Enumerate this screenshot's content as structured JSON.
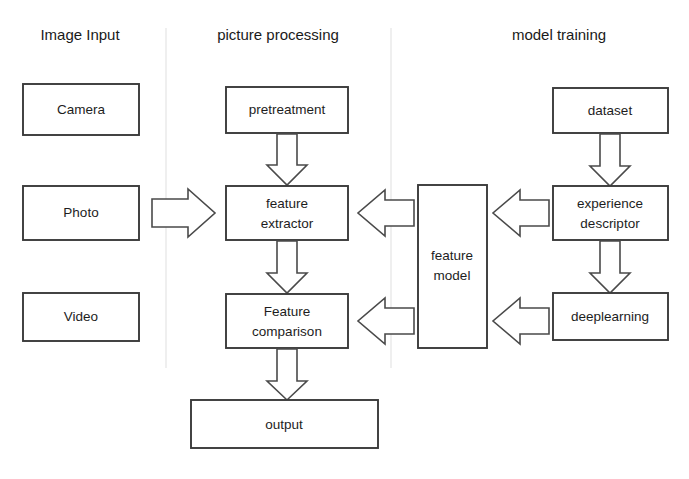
{
  "diagram": {
    "columns": [
      {
        "id": "image-input",
        "label": "Image Input"
      },
      {
        "id": "picture-processing",
        "label": "picture processing"
      },
      {
        "id": "model-training",
        "label": "model training"
      }
    ],
    "nodes": [
      {
        "id": "camera",
        "label": "Camera",
        "column": "image-input",
        "x": 23,
        "y": 84,
        "w": 116,
        "h": 51
      },
      {
        "id": "photo",
        "label": "Photo",
        "column": "image-input",
        "x": 23,
        "y": 186,
        "w": 116,
        "h": 54
      },
      {
        "id": "video",
        "label": "Video",
        "column": "image-input",
        "x": 23,
        "y": 293,
        "w": 116,
        "h": 48
      },
      {
        "id": "pretreatment",
        "label": "pretreatment",
        "column": "picture-processing",
        "x": 226,
        "y": 87,
        "w": 122,
        "h": 46
      },
      {
        "id": "feature-extractor",
        "label": "feature\nextractor",
        "column": "picture-processing",
        "x": 226,
        "y": 186,
        "w": 122,
        "h": 54
      },
      {
        "id": "feature-comparison",
        "label": "Feature\ncomparison",
        "column": "picture-processing",
        "x": 226,
        "y": 294,
        "w": 122,
        "h": 54
      },
      {
        "id": "output",
        "label": "output",
        "column": "picture-processing",
        "x": 191,
        "y": 400,
        "w": 187,
        "h": 48
      },
      {
        "id": "feature-model",
        "label": "feature\nmodel",
        "column": "picture-processing",
        "x": 418,
        "y": 185,
        "w": 69,
        "h": 163
      },
      {
        "id": "dataset",
        "label": "dataset",
        "column": "model-training",
        "x": 553,
        "y": 88,
        "w": 115,
        "h": 45
      },
      {
        "id": "experience-descriptor",
        "label": "experience\ndescriptor",
        "column": "model-training",
        "x": 553,
        "y": 186,
        "w": 115,
        "h": 54
      },
      {
        "id": "deeplearning",
        "label": "deeplearning",
        "column": "model-training",
        "x": 553,
        "y": 293,
        "w": 115,
        "h": 47
      }
    ],
    "edges": [
      {
        "id": "photo-to-feature-extractor",
        "from": "photo",
        "to": "feature-extractor",
        "direction": "right"
      },
      {
        "id": "pretreatment-to-feature-extractor",
        "from": "pretreatment",
        "to": "feature-extractor",
        "direction": "down"
      },
      {
        "id": "feature-extractor-to-feature-comparison",
        "from": "feature-extractor",
        "to": "feature-comparison",
        "direction": "down"
      },
      {
        "id": "feature-comparison-to-output",
        "from": "feature-comparison",
        "to": "output",
        "direction": "down"
      },
      {
        "id": "feature-model-to-feature-extractor",
        "from": "feature-model",
        "to": "feature-extractor",
        "direction": "left"
      },
      {
        "id": "feature-model-to-feature-comparison",
        "from": "feature-model",
        "to": "feature-comparison",
        "direction": "left"
      },
      {
        "id": "experience-descriptor-to-feature-model",
        "from": "experience-descriptor",
        "to": "feature-model",
        "direction": "left"
      },
      {
        "id": "deeplearning-to-feature-model",
        "from": "deeplearning",
        "to": "feature-model",
        "direction": "left"
      },
      {
        "id": "dataset-to-experience-descriptor",
        "from": "dataset",
        "to": "experience-descriptor",
        "direction": "down"
      },
      {
        "id": "experience-descriptor-to-deeplearning",
        "from": "experience-descriptor",
        "to": "deeplearning",
        "direction": "down"
      }
    ],
    "colors": {
      "background": "#ffffff",
      "box_stroke": "#3a3a3a",
      "arrow_stroke": "#4a4a4a",
      "text": "#1a1a1a",
      "divider": "#e8e8e8"
    },
    "caption": ""
  }
}
